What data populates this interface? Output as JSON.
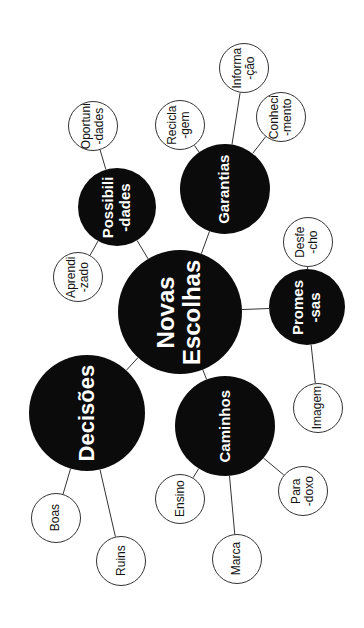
{
  "diagram": {
    "title": "Novas Escolhas",
    "center": {
      "id": "novas-escolhas",
      "label": "Novas\nEscolhas",
      "x": 180,
      "y": 312,
      "r": 62,
      "font_size": 24
    },
    "branches": [
      {
        "id": "decisoes",
        "label": "Decisões",
        "x": 87,
        "y": 413,
        "r": 58,
        "font_size": 22,
        "children": [
          {
            "id": "boas",
            "label": "Boas",
            "x": 56,
            "y": 518,
            "r": 25
          },
          {
            "id": "ruins",
            "label": "Ruins",
            "x": 121,
            "y": 561,
            "r": 25
          }
        ]
      },
      {
        "id": "caminhos",
        "label": "Caminhos",
        "x": 225,
        "y": 426,
        "r": 50,
        "font_size": 15,
        "children": [
          {
            "id": "ensino",
            "label": "Ensino",
            "x": 180,
            "y": 499,
            "r": 25
          },
          {
            "id": "marca",
            "label": "Marca",
            "x": 237,
            "y": 559,
            "r": 25
          },
          {
            "id": "paradoxo",
            "label": "Para\n-doxo",
            "x": 303,
            "y": 491,
            "r": 25
          }
        ]
      },
      {
        "id": "possibilidades",
        "label": "Possibili\n-dades",
        "x": 117,
        "y": 207,
        "r": 39,
        "font_size": 15,
        "children": [
          {
            "id": "oportunidades",
            "label": "Oportuni\n-dades",
            "x": 93,
            "y": 126,
            "r": 25
          },
          {
            "id": "aprendizado",
            "label": "Aprendi\n-zado",
            "x": 78,
            "y": 277,
            "r": 25
          }
        ]
      },
      {
        "id": "garantias",
        "label": "Garantias",
        "x": 225,
        "y": 189,
        "r": 45,
        "font_size": 15,
        "children": [
          {
            "id": "reciclagem",
            "label": "Recicla\n-gem",
            "x": 180,
            "y": 125,
            "r": 25
          },
          {
            "id": "informacao",
            "label": "Informa\n-ção",
            "x": 244,
            "y": 68,
            "r": 25
          },
          {
            "id": "conhecimento",
            "label": "Conheci\n-mento",
            "x": 281,
            "y": 117,
            "r": 25
          }
        ]
      },
      {
        "id": "promessas",
        "label": "Promes\n-sas",
        "x": 307,
        "y": 307,
        "r": 38,
        "font_size": 15,
        "children": [
          {
            "id": "desfecho",
            "label": "Desfe\n-cho",
            "x": 308,
            "y": 242,
            "r": 25
          },
          {
            "id": "imagem",
            "label": "Imagem",
            "x": 318,
            "y": 408,
            "r": 25
          }
        ]
      }
    ]
  },
  "colors": {
    "node_fill": "#0b0b0b",
    "node_text": "#ffffff",
    "leaf_border": "#333333",
    "line": "#333333",
    "background": "#ffffff"
  }
}
